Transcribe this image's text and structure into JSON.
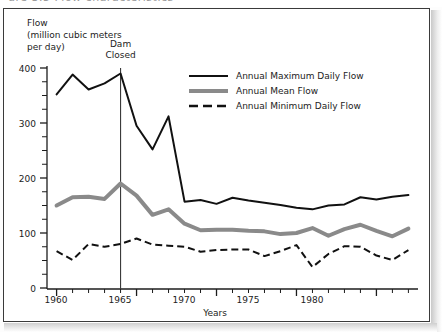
{
  "figure": {
    "top_clipped_text": "ure 3.5  Flow characteristics",
    "frame_color": "#3a3a3a",
    "background": "#ffffff"
  },
  "chart_data": {
    "type": "line",
    "title": "",
    "xlabel": "Years",
    "ylabel": "Flow\n(million cubic meters\nper day)",
    "ylabel_lines": [
      "Flow",
      "(million cubic meters",
      "per day)"
    ],
    "xlim": [
      1959.4,
      1982.6
    ],
    "ylim": [
      0,
      400
    ],
    "ytick_values": [
      0,
      100,
      200,
      300,
      400
    ],
    "ytick_labels": [
      "0",
      "100",
      "200",
      "300",
      "400"
    ],
    "y_minor_step": 25,
    "xtick_values": [
      1960,
      1965,
      1970,
      1975,
      1980
    ],
    "xtick_labels": [
      "1960",
      "1965",
      "1970",
      "1975",
      "1980"
    ],
    "x_minor_step": 1,
    "grid": false,
    "legend_position": "upper right inside",
    "x": [
      1960,
      1961,
      1962,
      1963,
      1964,
      1965,
      1966,
      1967,
      1968,
      1969,
      1970,
      1971,
      1972,
      1973,
      1974,
      1975,
      1976,
      1977,
      1978,
      1979,
      1980,
      1981,
      1982
    ],
    "series": [
      {
        "name": "Annual Maximum Daily Flow",
        "style": "solid",
        "color": "#111111",
        "width": 2.0,
        "values": [
          352,
          388,
          361,
          372,
          390,
          295,
          252,
          312,
          157,
          160,
          153,
          164,
          159,
          155,
          151,
          146,
          143,
          150,
          152,
          165,
          161,
          166,
          169
        ]
      },
      {
        "name": "Annual Mean Flow",
        "style": "solid",
        "color": "#8a8a8a",
        "width": 4.0,
        "values": [
          150,
          165,
          166,
          162,
          190,
          168,
          133,
          143,
          117,
          105,
          106,
          106,
          104,
          103,
          98,
          100,
          109,
          95,
          107,
          115,
          104,
          94,
          108
        ]
      },
      {
        "name": "Annual Minimum Daily Flow",
        "style": "dashed",
        "color": "#111111",
        "width": 2.0,
        "values": [
          67,
          51,
          80,
          75,
          80,
          90,
          79,
          77,
          75,
          66,
          69,
          70,
          70,
          58,
          67,
          78,
          38,
          62,
          76,
          75,
          59,
          51,
          69
        ]
      }
    ],
    "annotations": [
      {
        "name": "dam-closed",
        "lines": [
          "Dam",
          "Closed"
        ],
        "x": 1964,
        "type": "vline",
        "color": "#3a3a3a"
      }
    ]
  },
  "legend": {
    "items": [
      {
        "label": "Annual Maximum Daily Flow",
        "style": "solid",
        "color": "#111111"
      },
      {
        "label": "Annual Mean Flow",
        "style": "solid",
        "color": "#8a8a8a"
      },
      {
        "label": "Annual Minimum Daily Flow",
        "style": "dashed",
        "color": "#111111"
      }
    ]
  }
}
